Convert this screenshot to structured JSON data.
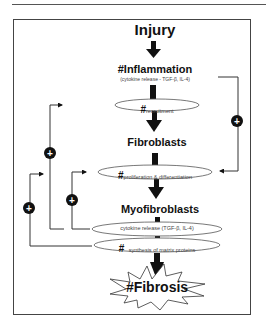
{
  "diagram": {
    "nodes": {
      "injury": "Injury",
      "inflammation": "#Inflammation",
      "inflammation_sub": "(cytokine release - TGF-β, IL-4)",
      "recruitment_hash": "#",
      "recruitment": "recruitment",
      "fibroblasts": "Fibroblasts",
      "prolif_hash": "#",
      "proliferation": "proliferation & differentiation",
      "myofibroblasts": "Myofibroblasts",
      "cytokine": "cytokine release (TGF-β, IL-4)",
      "synthesis_hash": "#",
      "synthesis": "synthesis of matrix proteins",
      "fibrosis": "#Fibrosis"
    },
    "feedback_symbol": "+",
    "edges": [
      {
        "from": "Injury",
        "to": "#Inflammation",
        "type": "arrow"
      },
      {
        "from": "#Inflammation",
        "to": "recruitment",
        "type": "bar"
      },
      {
        "from": "recruitment",
        "to": "Fibroblasts",
        "type": "arrow"
      },
      {
        "from": "Fibroblasts",
        "to": "proliferation & differentiation",
        "type": "bar"
      },
      {
        "from": "proliferation & differentiation",
        "to": "Myofibroblasts",
        "type": "arrow"
      },
      {
        "from": "Myofibroblasts",
        "to": "cytokine release",
        "type": "bar"
      },
      {
        "from": "synthesis of matrix proteins",
        "to": "#Fibrosis",
        "type": "arrow"
      },
      {
        "from": "Inflammation cytokine release",
        "to": "proliferation & differentiation",
        "type": "positive feedback"
      },
      {
        "from": "cytokine release",
        "to": "recruitment",
        "type": "positive feedback"
      },
      {
        "from": "cytokine release",
        "to": "proliferation & differentiation",
        "type": "positive feedback"
      },
      {
        "from": "synthesis of matrix proteins",
        "to": "proliferation & differentiation",
        "type": "positive feedback"
      }
    ]
  }
}
